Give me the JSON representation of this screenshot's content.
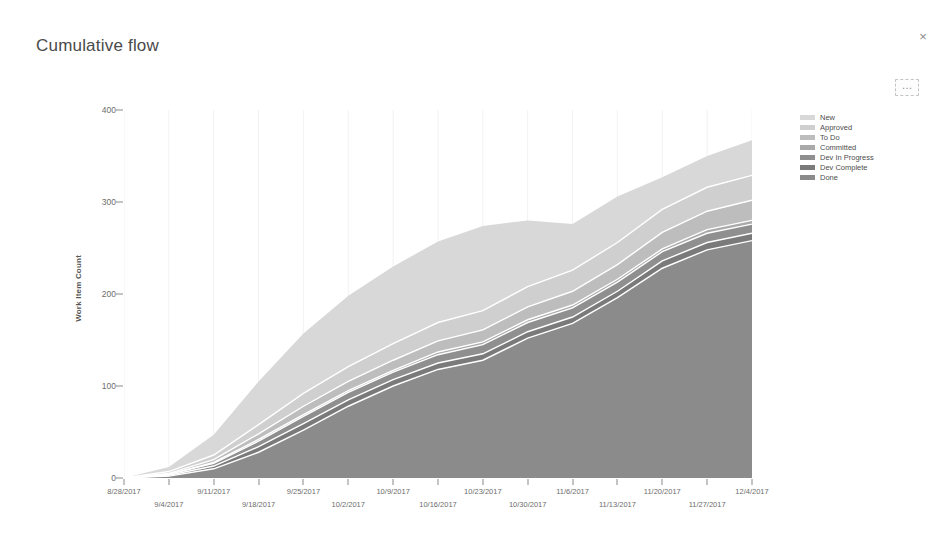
{
  "widget": {
    "title": "Cumulative flow",
    "close_label": "×",
    "more_label": "…"
  },
  "legend": {
    "position": "right",
    "items": [
      {
        "label": "New",
        "color": "#d8d8d8"
      },
      {
        "label": "Approved",
        "color": "#cfcfcf"
      },
      {
        "label": "To Do",
        "color": "#bdbdbd"
      },
      {
        "label": "Committed",
        "color": "#a9a9a9"
      },
      {
        "label": "Dev In Progress",
        "color": "#8f8f8f"
      },
      {
        "label": "Dev Complete",
        "color": "#7a7a7a"
      },
      {
        "label": "Done",
        "color": "#8b8b8b"
      }
    ]
  },
  "chart_data": {
    "type": "area",
    "stacked": true,
    "title": "Cumulative flow",
    "xlabel": "",
    "ylabel": "Work Item Count",
    "ylim": [
      0,
      400
    ],
    "yticks": [
      0,
      100,
      200,
      300,
      400
    ],
    "grid": "vertical-faint",
    "separator_color": "#ffffff",
    "x": [
      "8/28/2017",
      "9/4/2017",
      "9/11/2017",
      "9/18/2017",
      "9/25/2017",
      "10/2/2017",
      "10/9/2017",
      "10/16/2017",
      "10/23/2017",
      "10/30/2017",
      "11/6/2017",
      "11/13/2017",
      "11/20/2017",
      "11/27/2017",
      "12/4/2017"
    ],
    "xtick_labels": [
      "8/28/2017",
      "9/4/2017",
      "9/11/2017",
      "9/18/2017",
      "9/25/2017",
      "10/2/2017",
      "10/9/2017",
      "10/16/2017",
      "10/23/2017",
      "10/30/2017",
      "11/6/2017",
      "11/13/2017",
      "11/20/2017",
      "11/27/2017",
      "12/4/2017"
    ],
    "series": [
      {
        "name": "Done",
        "color": "#8b8b8b",
        "values": [
          0,
          2,
          10,
          28,
          52,
          78,
          100,
          118,
          128,
          152,
          168,
          196,
          228,
          248,
          258
        ]
      },
      {
        "name": "Dev Complete",
        "color": "#7a7a7a",
        "values": [
          0,
          1,
          3,
          6,
          7,
          7,
          7,
          7,
          7,
          7,
          7,
          7,
          8,
          8,
          8
        ]
      },
      {
        "name": "Dev In Progress",
        "color": "#8f8f8f",
        "values": [
          0,
          1,
          3,
          6,
          8,
          8,
          8,
          9,
          10,
          10,
          10,
          10,
          10,
          10,
          10
        ]
      },
      {
        "name": "Committed",
        "color": "#a9a9a9",
        "values": [
          0,
          0,
          1,
          2,
          2,
          2,
          2,
          3,
          3,
          3,
          3,
          3,
          3,
          4,
          4
        ]
      },
      {
        "name": "To Do",
        "color": "#bdbdbd",
        "values": [
          0,
          1,
          3,
          6,
          9,
          10,
          11,
          12,
          13,
          14,
          15,
          16,
          18,
          20,
          22
        ]
      },
      {
        "name": "Approved",
        "color": "#cfcfcf",
        "values": [
          0,
          2,
          5,
          10,
          14,
          16,
          18,
          20,
          21,
          22,
          23,
          24,
          25,
          26,
          27
        ]
      },
      {
        "name": "New",
        "color": "#d8d8d8",
        "values": [
          0,
          5,
          22,
          47,
          65,
          77,
          84,
          88,
          92,
          72,
          50,
          50,
          35,
          34,
          38
        ]
      }
    ],
    "totals": [
      0,
      12,
      47,
      105,
      157,
      198,
      230,
      257,
      274,
      280,
      276,
      306,
      327,
      350,
      367
    ]
  }
}
